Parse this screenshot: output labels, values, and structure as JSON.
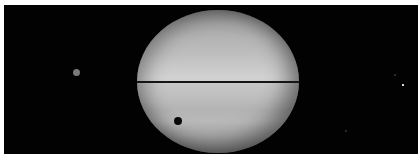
{
  "image": {
    "subject": "Planet with edge-on ring plane, moons and a moon shadow transit",
    "background_color": "#020202",
    "planet": {
      "shape": "ellipse",
      "tone": "grayscale banded",
      "ring_line": "dark horizontal line across equator"
    },
    "features": [
      {
        "name": "moon-shadow",
        "position": "lower-left of planet disk",
        "color": "#080808"
      },
      {
        "name": "moon-left",
        "position": "left of planet",
        "color": "#7a7a7a"
      },
      {
        "name": "moon-right",
        "position": "far right",
        "color": "#d8d8d8"
      }
    ]
  }
}
